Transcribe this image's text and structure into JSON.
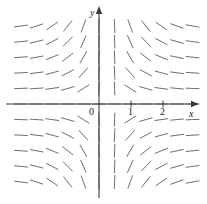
{
  "chart_data": {
    "type": "scatter",
    "title": "",
    "subtitle": "",
    "xlabel": "x",
    "ylabel": "y",
    "xlim": [
      -2.6,
      3.2
    ],
    "ylim": [
      -2.5,
      2.4
    ],
    "grid": false,
    "legend": null,
    "annotations": [],
    "axes": {
      "x_axis_pixel_y": 104,
      "y_axis_pixel_x": 99,
      "x_tick_labels": [
        "0",
        "1",
        "2"
      ],
      "x_tick_values": [
        0,
        1,
        2
      ],
      "y_tick_labels": [],
      "y_tick_values": [],
      "origin_label": "0",
      "arrowheads": [
        "x-positive",
        "y-positive"
      ]
    },
    "field": {
      "pixels_per_unit_x": 32,
      "pixels_per_unit_y": 32,
      "grid_spacing_px": 15.6,
      "origin_px": [
        99,
        104
      ],
      "segment_length_px": 13,
      "segment_color": "#6e6e6e",
      "segment_width_px": 1,
      "slope_rule": "dy/dx proportional to x*y (steep near y-axis, flat far from it; positive slope in quadrants I and III, negative slope in quadrants II and IV)",
      "x_samples": [
        -5,
        -4,
        -3,
        -2,
        -1,
        0,
        1,
        2,
        3,
        4,
        5,
        6
      ],
      "y_samples": [
        5,
        4,
        3,
        2,
        1,
        0,
        -1,
        -2,
        -3,
        -4,
        -5
      ],
      "angles_deg_rows": [
        [
          8,
          18,
          34,
          52,
          70,
          88,
          -88,
          -70,
          -52,
          -34,
          -20,
          -10
        ],
        [
          6,
          14,
          28,
          46,
          66,
          88,
          -88,
          -66,
          -46,
          -28,
          -16,
          -8
        ],
        [
          4,
          10,
          22,
          38,
          60,
          88,
          -88,
          -60,
          -38,
          -22,
          -12,
          -6
        ],
        [
          3,
          7,
          15,
          28,
          48,
          88,
          -88,
          -48,
          -28,
          -15,
          -8,
          -4
        ],
        [
          2,
          4,
          8,
          16,
          32,
          88,
          -88,
          -32,
          -16,
          -8,
          -5,
          -2
        ],
        [
          0,
          0,
          0,
          0,
          0,
          0,
          0,
          0,
          0,
          0,
          0,
          0
        ],
        [
          -2,
          -4,
          -8,
          -16,
          -32,
          -88,
          88,
          32,
          16,
          8,
          5,
          2
        ],
        [
          -3,
          -7,
          -15,
          -28,
          -48,
          -88,
          88,
          48,
          28,
          15,
          8,
          4
        ],
        [
          -4,
          -10,
          -22,
          -38,
          -60,
          -88,
          88,
          60,
          38,
          22,
          12,
          6
        ],
        [
          -6,
          -14,
          -28,
          -46,
          -66,
          -88,
          88,
          66,
          46,
          28,
          16,
          8
        ],
        [
          -8,
          -18,
          -34,
          -52,
          -70,
          -88,
          88,
          70,
          52,
          34,
          20,
          10
        ]
      ]
    },
    "colors": {
      "axis": "#3a3a3a",
      "segment": "#6e6e6e",
      "text": "#1a1a1a",
      "background": "#ffffff"
    }
  },
  "labels": {
    "y_axis": "y",
    "x_axis": "x",
    "tick_0": "0",
    "tick_1": "1",
    "tick_2": "2"
  }
}
